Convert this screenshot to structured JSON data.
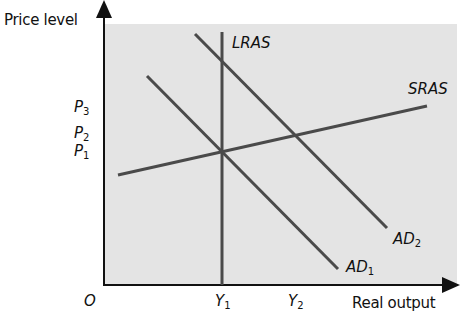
{
  "diagram": {
    "y_axis_label": "Price level",
    "x_axis_label": "Real output",
    "origin_label": "O",
    "y_ticks": [
      {
        "base": "P",
        "sub": "3"
      },
      {
        "base": "P",
        "sub": "2"
      },
      {
        "base": "P",
        "sub": "1"
      }
    ],
    "x_ticks": [
      {
        "base": "Y",
        "sub": "1"
      },
      {
        "base": "Y",
        "sub": "2"
      }
    ],
    "curves": {
      "lras": {
        "label": "LRAS"
      },
      "sras": {
        "label": "SRAS"
      },
      "ad1": {
        "base": "AD",
        "sub": "1"
      },
      "ad2": {
        "base": "AD",
        "sub": "2"
      }
    },
    "colors": {
      "panel": "#e4e4e4",
      "curve": "#4a4a4a",
      "axis": "#111111"
    }
  }
}
